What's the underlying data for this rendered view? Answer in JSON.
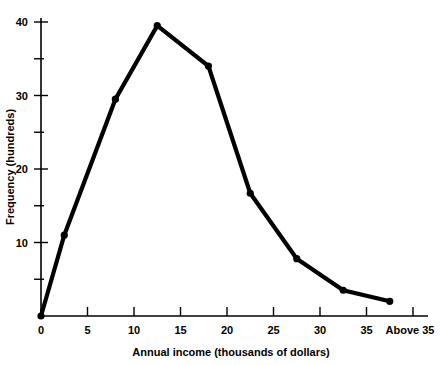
{
  "chart_data": {
    "type": "line",
    "title": "",
    "xlabel": "Annual income (thousands of dollars)",
    "ylabel": "Frequency (hundreds)",
    "xlim": [
      0,
      40
    ],
    "ylim": [
      0,
      41
    ],
    "grid": false,
    "legend": null,
    "x_tick_values": [
      0,
      5,
      10,
      15,
      20,
      25,
      30,
      35,
      40
    ],
    "x_tick_labels": [
      "0",
      "5",
      "10",
      "15",
      "20",
      "25",
      "30",
      "35",
      "Above 35"
    ],
    "y_tick_values": [
      0,
      5,
      10,
      15,
      20,
      25,
      30,
      35,
      40
    ],
    "y_tick_labels": [
      "",
      "",
      "10",
      "",
      "20",
      "",
      "30",
      "",
      "40"
    ],
    "x": [
      0,
      2.5,
      8,
      12.5,
      18,
      22.5,
      27.5,
      32.5,
      37.5
    ],
    "values": [
      0,
      11,
      29.5,
      39.5,
      34,
      16.7,
      7.8,
      3.5,
      2
    ],
    "series": [
      {
        "name": "Frequency",
        "color": "#000000",
        "points": [
          {
            "x": 0,
            "y": 0
          },
          {
            "x": 2.5,
            "y": 11
          },
          {
            "x": 8,
            "y": 29.5
          },
          {
            "x": 12.5,
            "y": 39.5
          },
          {
            "x": 18,
            "y": 34
          },
          {
            "x": 22.5,
            "y": 16.7
          },
          {
            "x": 27.5,
            "y": 7.8
          },
          {
            "x": 32.5,
            "y": 3.5
          },
          {
            "x": 37.5,
            "y": 2
          }
        ]
      }
    ]
  },
  "axis": {
    "x_label": "Annual income (thousands of dollars)",
    "y_label": "Frequency (hundreds)",
    "x_ticks": [
      "0",
      "5",
      "10",
      "15",
      "20",
      "25",
      "30",
      "35",
      "Above 35"
    ],
    "y_ticks": [
      "10",
      "20",
      "30",
      "40"
    ]
  },
  "colors": {
    "line": "#000000",
    "axis": "#000000",
    "background": "#ffffff"
  }
}
